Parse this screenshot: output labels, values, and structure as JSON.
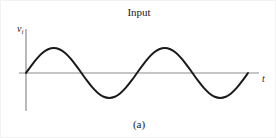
{
  "figure": {
    "title": "Input",
    "caption": "(a)",
    "y_axis_label_symbol": "v",
    "y_axis_label_subscript": "i",
    "x_axis_label": "t"
  },
  "colors": {
    "curve": "#1a1a1a",
    "axis": "#8c8c8c",
    "text": "#1a1a1a",
    "background": "#ffffff",
    "border": "#f2f2f2"
  },
  "chart_data": {
    "type": "line",
    "title": "Input",
    "subtitle": "(a)",
    "xlabel": "t",
    "ylabel": "v_i",
    "grid": false,
    "legend": null,
    "annotations": [
      "(a)"
    ],
    "axis_style": "two-axis: vertical v_i axis at left, horizontal t axis through zero",
    "xlim": [
      0,
      2.0
    ],
    "ylim": [
      -1.25,
      1.25
    ],
    "waveform": {
      "shape": "sine",
      "description": "Sinusoidal input voltage, two full cycles, starting at zero and rising",
      "amplitude": 1.0,
      "cycles": 2,
      "phase": 0,
      "period": 1.0
    },
    "x": [
      0,
      0.05,
      0.1,
      0.15,
      0.2,
      0.25,
      0.3,
      0.35,
      0.4,
      0.45,
      0.5,
      0.55,
      0.6,
      0.65,
      0.7,
      0.75,
      0.8,
      0.85,
      0.9,
      0.95,
      1.0,
      1.05,
      1.1,
      1.15,
      1.2,
      1.25,
      1.3,
      1.35,
      1.4,
      1.45,
      1.5,
      1.55,
      1.6,
      1.65,
      1.7,
      1.75,
      1.8,
      1.85,
      1.9,
      1.95,
      2.0
    ],
    "y": [
      0,
      0.309,
      0.588,
      0.809,
      0.951,
      1.0,
      0.951,
      0.809,
      0.588,
      0.309,
      0,
      -0.309,
      -0.588,
      -0.809,
      -0.951,
      -1.0,
      -0.951,
      -0.809,
      -0.588,
      -0.309,
      0,
      0.309,
      0.588,
      0.809,
      0.951,
      1.0,
      0.951,
      0.809,
      0.588,
      0.309,
      0,
      -0.309,
      -0.588,
      -0.809,
      -0.951,
      -1.0,
      -0.951,
      -0.809,
      -0.588,
      -0.309,
      0
    ]
  }
}
